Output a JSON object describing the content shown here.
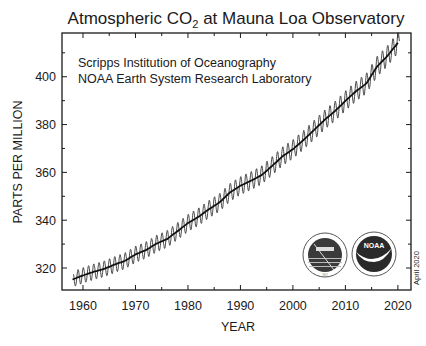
{
  "chart_data": {
    "type": "line",
    "title": "Atmospheric CO",
    "title_subscript": "2",
    "title_suffix": " at Mauna Loa Observatory",
    "xlabel": "YEAR",
    "ylabel": "PARTS PER MILLION",
    "xlim": [
      1956,
      2022.5
    ],
    "ylim": [
      310.8,
      418.3
    ],
    "x_ticks": [
      1960,
      1970,
      1980,
      1990,
      2000,
      2010,
      2020
    ],
    "y_ticks": [
      320,
      340,
      360,
      380,
      400
    ],
    "grid": false,
    "annotations": [
      "Scripps Institution of Oceanography",
      "NOAA Earth System Research Laboratory"
    ],
    "date_stamp": "April 2020",
    "logos": [
      "scripps-logo",
      "noaa-logo"
    ],
    "series": [
      {
        "name": "Annual mean (deseasonalized trend)",
        "style": "thick-line",
        "x": [
          1958,
          1960,
          1962,
          1964,
          1966,
          1968,
          1970,
          1972,
          1974,
          1976,
          1978,
          1980,
          1982,
          1984,
          1986,
          1988,
          1990,
          1992,
          1994,
          1996,
          1998,
          2000,
          2002,
          2004,
          2006,
          2008,
          2010,
          2012,
          2014,
          2016,
          2018,
          2020
        ],
        "values": [
          315.2,
          316.9,
          318.4,
          319.6,
          321.4,
          323.0,
          325.7,
          327.5,
          330.2,
          332.1,
          335.4,
          338.8,
          341.4,
          344.6,
          347.4,
          351.6,
          354.4,
          356.5,
          358.8,
          362.6,
          366.7,
          369.7,
          373.5,
          377.7,
          381.9,
          385.6,
          389.9,
          393.9,
          397.2,
          404.2,
          408.7,
          414.2
        ]
      },
      {
        "name": "Monthly mean (seasonal cycle)",
        "style": "thin-oscillating-line",
        "seasonal_amplitude_ppm": 3.2
      }
    ]
  }
}
